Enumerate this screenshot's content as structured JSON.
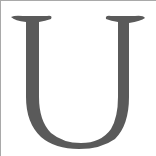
{
  "glyph": {
    "character": "U",
    "color": "#5a5a5a"
  },
  "frame": {
    "border_color": "#a9a9a9",
    "background": "#ffffff"
  }
}
